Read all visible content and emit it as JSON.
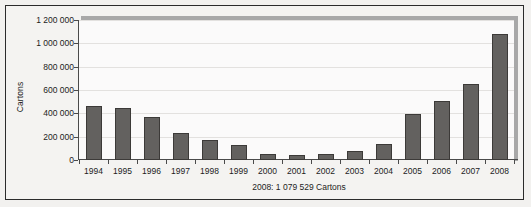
{
  "chart_data": {
    "type": "bar",
    "title": "",
    "subtitle": "",
    "xlabel": "",
    "ylabel": "Cartons",
    "caption": "2008: 1 079 529 Cartons",
    "grid": true,
    "legend": "none",
    "ylim": [
      0,
      1200000
    ],
    "ytick_labels": [
      "1 200 000",
      "1 000 000",
      "800 000",
      "600 000",
      "400 000",
      "200 000",
      "0"
    ],
    "ytick_values": [
      1200000,
      1000000,
      800000,
      600000,
      400000,
      200000,
      0
    ],
    "categories": [
      "1994",
      "1995",
      "1996",
      "1997",
      "1998",
      "1999",
      "2000",
      "2001",
      "2002",
      "2003",
      "2004",
      "2005",
      "2006",
      "2007",
      "2008"
    ],
    "values": [
      460000,
      445000,
      365000,
      235000,
      170000,
      130000,
      50000,
      40000,
      52000,
      80000,
      140000,
      398000,
      502000,
      655000,
      1079529
    ],
    "series": [
      {
        "name": "Cartons",
        "color": "#63615f",
        "values": [
          460000,
          445000,
          365000,
          235000,
          170000,
          130000,
          50000,
          40000,
          52000,
          80000,
          140000,
          398000,
          502000,
          655000,
          1079529
        ]
      }
    ]
  },
  "colors": {
    "bar_fill": "#63615f",
    "bar_edge": "#3c3a38",
    "axis": "#4a4a4a",
    "grid": "#e3e1df",
    "plot_background": "#fbfafa",
    "figure_background": "#f4f3f1",
    "frame": "#2b2b2b",
    "shadow": "#a8a8a8",
    "text": "#1c1c1c"
  }
}
